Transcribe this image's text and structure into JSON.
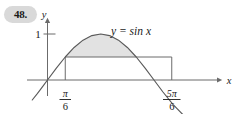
{
  "problem": {
    "number": "48."
  },
  "figure": {
    "curve_label": "y = sin x",
    "y_axis_label": "y",
    "x_axis_label": "x",
    "y_tick_label": "1",
    "x_tick_labels": [
      {
        "numerator": "π",
        "denominator": "6"
      },
      {
        "numerator": "5π",
        "denominator": "6"
      }
    ],
    "colors": {
      "shaded_region": "#e2e2e2",
      "curve": "#5a5a5a",
      "axis": "#6b6b6b",
      "rectangle": "#6b6b6b",
      "badge": "#d9d9d9",
      "text": "#1a1a1a"
    }
  },
  "chart_data": {
    "type": "line",
    "title": "",
    "xlabel": "x",
    "ylabel": "y",
    "function": "y = sin x",
    "xlim": [
      -0.45,
      4.35
    ],
    "ylim": [
      -0.62,
      1.28
    ],
    "grid": false,
    "legend": "none",
    "x_ticks": [
      0.5235987756,
      2.617993878
    ],
    "x_tick_labels": [
      "π/6",
      "5π/6"
    ],
    "y_ticks": [
      1
    ],
    "y_tick_labels": [
      "1"
    ],
    "series": [
      {
        "name": "y = sin x",
        "x": [
          -0.45,
          -0.3,
          -0.15,
          0,
          0.2617993878,
          0.5235987756,
          0.7853981634,
          1.0471975512,
          1.308996939,
          1.5707963268,
          1.8325957146,
          2.0943951024,
          2.3561944902,
          2.617993878,
          2.8797932658,
          3.1415926536,
          3.4,
          3.7,
          4.0,
          4.35
        ],
        "y": [
          -0.435,
          -0.2955,
          -0.1494,
          0,
          0.2588,
          0.5,
          0.7071,
          0.866,
          0.9659,
          1.0,
          0.9659,
          0.866,
          0.7071,
          0.5,
          0.2588,
          0,
          -0.2555,
          -0.5298,
          -0.7568,
          -0.936
        ]
      }
    ],
    "annotations": [
      {
        "type": "shaded_region",
        "description": "Region between the chord y = 1/2 and the sine curve from x = π/6 to x = 5π/6",
        "x_start": 0.5235987756,
        "x_end": 2.617993878,
        "y_lower": 0.5,
        "y_upper_function": "sin x",
        "color": "#e2e2e2"
      },
      {
        "type": "inscribed_rectangle",
        "description": "Rectangle with base on the x-axis from π/6 to 5π/6 and height 1/2",
        "x_start": 0.5235987756,
        "x_end": 2.617993878,
        "y_bottom": 0,
        "y_top": 0.5,
        "width": 2.0943951024,
        "height": 0.5
      }
    ]
  }
}
